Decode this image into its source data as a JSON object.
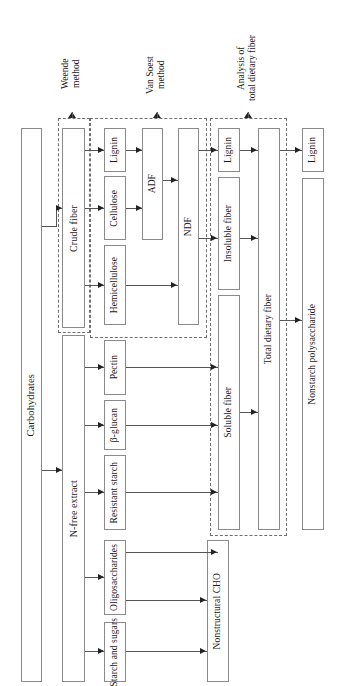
{
  "diagram": {
    "orientation": "rotated-90-ccw",
    "method_captions": [
      {
        "id": "weende",
        "text": "Weende\nmethod"
      },
      {
        "id": "vansoest",
        "text": "Van Soest\nmethod"
      },
      {
        "id": "tdf",
        "text": "Analysis of\ntotal dietary fiber"
      }
    ],
    "nodes": [
      {
        "id": "carbohydrates",
        "label": "Carbohydrates"
      },
      {
        "id": "crude_fiber",
        "label": "Crude fiber"
      },
      {
        "id": "nfree_extract",
        "label": "N-free extract"
      },
      {
        "id": "lignin_1",
        "label": "Lignin"
      },
      {
        "id": "cellulose",
        "label": "Cellulose"
      },
      {
        "id": "hemicellulose",
        "label": "Hemicellulose"
      },
      {
        "id": "pectin",
        "label": "Pectin"
      },
      {
        "id": "beta_glucan",
        "label": "β-glucan"
      },
      {
        "id": "resistant_starch",
        "label": "Resistant starch"
      },
      {
        "id": "oligosaccharides",
        "label": "Oligosaccharides"
      },
      {
        "id": "starch_sugars",
        "label": "Starch and sugars"
      },
      {
        "id": "adf",
        "label": "ADF"
      },
      {
        "id": "ndf",
        "label": "NDF"
      },
      {
        "id": "lignin_2",
        "label": "Lignin"
      },
      {
        "id": "insoluble_fiber",
        "label": "Insoluble fiber"
      },
      {
        "id": "soluble_fiber",
        "label": "Soluble fiber"
      },
      {
        "id": "nonstructural_cho",
        "label": "Nonstructural CHO"
      },
      {
        "id": "total_dietary_fiber",
        "label": "Total dietary fiber"
      },
      {
        "id": "lignin_3",
        "label": "Lignin"
      },
      {
        "id": "nonstarch_polysaccharide",
        "label": "Nonstarch polysaccharide"
      }
    ],
    "colors": {
      "box_border": "#8a8a8a",
      "group_border": "#6f6f6f",
      "connector": "#555555",
      "arrow": "#222222",
      "background": "#ffffff"
    }
  }
}
